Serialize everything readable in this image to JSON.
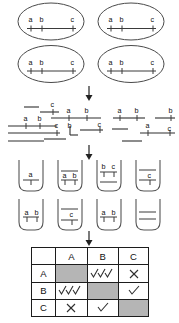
{
  "figure": {
    "title": "",
    "markers": [
      "a",
      "b",
      "c"
    ],
    "stages": [
      {
        "name": "clones",
        "label": ""
      },
      {
        "name": "fragments",
        "label": ""
      },
      {
        "name": "pools",
        "label": ""
      },
      {
        "name": "matrix",
        "label": ""
      }
    ]
  },
  "clones": {
    "count": 4,
    "items": [
      {
        "id": "clone-1",
        "labels": [
          "a",
          "b",
          "c"
        ]
      },
      {
        "id": "clone-2",
        "labels": [
          "a",
          "b",
          "c"
        ]
      },
      {
        "id": "clone-3",
        "labels": [
          "a",
          "b",
          "c"
        ]
      },
      {
        "id": "clone-4",
        "labels": [
          "a",
          "b",
          "c"
        ]
      }
    ]
  },
  "fragments": {
    "count": 14,
    "items": [
      {
        "id": "fragment-1",
        "labels": []
      },
      {
        "id": "fragment-2",
        "labels": [
          "c"
        ]
      },
      {
        "id": "fragment-3",
        "labels": [
          "a",
          "b"
        ]
      },
      {
        "id": "fragment-4",
        "labels": [
          "a",
          "b"
        ]
      },
      {
        "id": "fragment-5",
        "labels": [
          "a",
          "b"
        ]
      },
      {
        "id": "fragment-6",
        "labels": [
          "b"
        ]
      },
      {
        "id": "fragment-7",
        "labels": [
          "c"
        ]
      },
      {
        "id": "fragment-8",
        "labels": [
          "b"
        ]
      },
      {
        "id": "fragment-9",
        "labels": [
          "c"
        ]
      },
      {
        "id": "fragment-10",
        "labels": []
      },
      {
        "id": "fragment-11",
        "labels": [
          "a"
        ]
      },
      {
        "id": "fragment-12",
        "labels": [
          "c"
        ]
      },
      {
        "id": "fragment-13",
        "labels": []
      },
      {
        "id": "fragment-14",
        "labels": []
      }
    ]
  },
  "pools": {
    "count": 8,
    "items": [
      {
        "id": "pool-1",
        "labels": [
          "a"
        ],
        "bands": 1
      },
      {
        "id": "pool-2",
        "labels": [
          "a",
          "b"
        ],
        "bands": 2
      },
      {
        "id": "pool-3",
        "labels": [
          "b",
          "c"
        ],
        "bands": 2
      },
      {
        "id": "pool-4",
        "labels": [
          "c"
        ],
        "bands": 2
      },
      {
        "id": "pool-5",
        "labels": [
          "a",
          "b"
        ],
        "bands": 1
      },
      {
        "id": "pool-6",
        "labels": [
          "c"
        ],
        "bands": 2
      },
      {
        "id": "pool-7",
        "labels": [
          "a",
          "b"
        ],
        "bands": 1
      },
      {
        "id": "pool-8",
        "labels": [],
        "bands": 2
      }
    ]
  },
  "matrix": {
    "corner_label": "",
    "columns": [
      "A",
      "B",
      "C"
    ],
    "rows": [
      "A",
      "B",
      "C"
    ],
    "cells": [
      [
        "diagonal",
        "check-triple",
        "cross"
      ],
      [
        "check-triple",
        "diagonal",
        "check-single"
      ],
      [
        "cross",
        "check-single",
        "diagonal"
      ]
    ],
    "symbols": {
      "check-single": "✓",
      "check-triple": "✓✓✓",
      "cross": "✕",
      "diagonal": ""
    }
  },
  "arrows": [
    {
      "id": "arrow-clones-to-fragments"
    },
    {
      "id": "arrow-fragments-to-pools"
    },
    {
      "id": "arrow-pools-to-matrix"
    }
  ],
  "colors": {
    "stroke": "#3a3a3a",
    "text": "#111111",
    "diagonal_fill": "#b5b5b5",
    "border": "#1c1c1c",
    "background": "#ffffff"
  }
}
